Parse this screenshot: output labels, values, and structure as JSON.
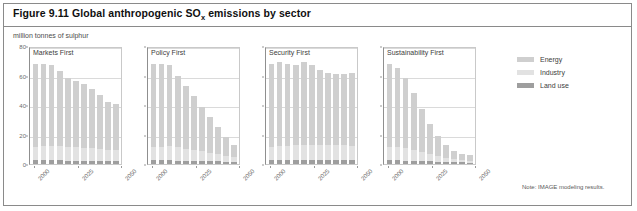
{
  "figure": {
    "title_prefix": "Figure 9.11 Global anthropogenic SO",
    "title_sub": "x",
    "title_suffix": " emissions by sector",
    "subtitle": "million tonnes of sulphur",
    "note": "Note: IMAGE modeling results."
  },
  "legend": {
    "items": [
      {
        "label": "Energy",
        "color": "#cfcfcf"
      },
      {
        "label": "Industry",
        "color": "#e2e2e2"
      },
      {
        "label": "Land use",
        "color": "#9e9e9e"
      }
    ]
  },
  "axes": {
    "y_ticks": [
      "0",
      "20",
      "40",
      "60",
      "80"
    ],
    "y_values": [
      0,
      20,
      40,
      60,
      80
    ],
    "x_ticks": [
      "2000",
      "2025",
      "2050"
    ]
  },
  "chart_data": {
    "type": "bar",
    "title": "Figure 9.11 Global anthropogenic SOx emissions by sector",
    "subtitle": "million tonnes of sulphur",
    "xlabel": "",
    "ylabel": "million tonnes of sulphur",
    "ylim": [
      0,
      80
    ],
    "grid": true,
    "legend_position": "right",
    "stacked": true,
    "note": "Note: IMAGE modeling results.",
    "categories": [
      "2000",
      "2005",
      "2010",
      "2015",
      "2020",
      "2025",
      "2030",
      "2035",
      "2040",
      "2045",
      "2050"
    ],
    "panels": [
      {
        "name": "Markets First",
        "series": [
          {
            "name": "Land use",
            "values": [
              2.5,
              2.5,
              2.4,
              2.4,
              2.3,
              2.3,
              2.2,
              2.2,
              2.1,
              2.0,
              2.0
            ]
          },
          {
            "name": "Industry",
            "values": [
              9.0,
              9.5,
              9.8,
              9.8,
              9.5,
              9.3,
              9.0,
              8.6,
              8.2,
              7.8,
              7.5
            ]
          },
          {
            "name": "Energy",
            "values": [
              56.5,
              56.0,
              54.8,
              50.8,
              46.2,
              44.4,
              42.8,
              40.2,
              36.7,
              32.2,
              31.5
            ]
          }
        ],
        "totals": [
          68,
          68,
          67,
          63,
          58,
          56,
          54,
          51,
          47,
          42,
          41
        ]
      },
      {
        "name": "Policy First",
        "series": [
          {
            "name": "Land use",
            "values": [
              2.5,
              2.5,
              2.4,
              2.3,
              2.2,
              2.1,
              2.0,
              1.9,
              1.8,
              1.7,
              1.6
            ]
          },
          {
            "name": "Industry",
            "values": [
              9.0,
              9.3,
              9.5,
              9.0,
              8.3,
              7.5,
              6.6,
              5.6,
              4.7,
              3.8,
              3.0
            ]
          },
          {
            "name": "Energy",
            "values": [
              56.5,
              56.2,
              55.1,
              48.7,
              42.5,
              36.4,
              30.4,
              24.5,
              18.5,
              12.5,
              8.4
            ]
          }
        ],
        "totals": [
          68,
          68,
          67,
          60,
          53,
          46,
          39,
          32,
          25,
          18,
          13
        ]
      },
      {
        "name": "Security First",
        "series": [
          {
            "name": "Land use",
            "values": [
              2.5,
              2.6,
              2.6,
              2.6,
              2.7,
              2.7,
              2.7,
              2.7,
              2.8,
              2.8,
              2.8
            ]
          },
          {
            "name": "Industry",
            "values": [
              9.0,
              9.6,
              9.9,
              10.0,
              10.2,
              10.2,
              10.1,
              10.0,
              9.9,
              9.8,
              9.7
            ]
          },
          {
            "name": "Energy",
            "values": [
              56.5,
              56.8,
              55.5,
              54.4,
              56.1,
              54.1,
              51.2,
              49.3,
              48.3,
              48.4,
              49.5
            ]
          }
        ],
        "totals": [
          68,
          69,
          68,
          67,
          69,
          67,
          64,
          62,
          61,
          61,
          62
        ]
      },
      {
        "name": "Sustainability First",
        "series": [
          {
            "name": "Land use",
            "values": [
              2.5,
              2.4,
              2.3,
              2.2,
              2.0,
              1.8,
              1.6,
              1.4,
              1.2,
              1.1,
              1.0
            ]
          },
          {
            "name": "Industry",
            "values": [
              9.0,
              9.0,
              8.4,
              7.3,
              6.0,
              4.7,
              3.6,
              2.7,
              2.0,
              1.5,
              1.2
            ]
          },
          {
            "name": "Energy",
            "values": [
              56.5,
              53.6,
              47.3,
              38.5,
              29.0,
              20.5,
              13.8,
              8.9,
              5.8,
              4.4,
              3.8
            ]
          }
        ],
        "totals": [
          68,
          65,
          58,
          48,
          37,
          27,
          19,
          13,
          9,
          7,
          6
        ]
      }
    ]
  }
}
